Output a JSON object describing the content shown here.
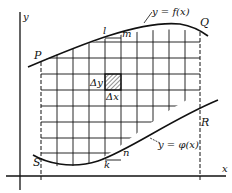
{
  "diagram": {
    "axes": {
      "x_label": "x",
      "y_label": "y"
    },
    "points": {
      "P": "P",
      "Q": "Q",
      "R": "R",
      "S": "S",
      "l": "l",
      "m": "m",
      "k": "k",
      "n": "n"
    },
    "curves": {
      "upper": "y = f(x)",
      "lower": "y = φ(x)"
    },
    "cell": {
      "dy": "Δy",
      "dx": "Δx"
    },
    "colors": {
      "ink": "#111111",
      "background": "#ffffff"
    }
  }
}
